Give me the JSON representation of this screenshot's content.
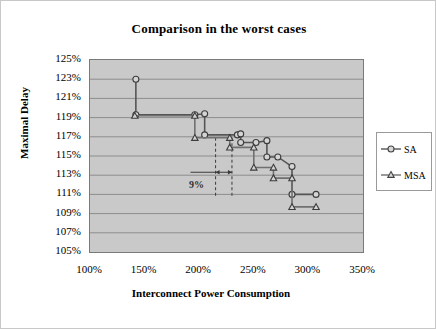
{
  "chart_data": {
    "type": "line",
    "title": "Comparison in the worst cases",
    "xlabel": "Interconnect Power Consumption",
    "ylabel": "Maximal Delay",
    "xlim": [
      100,
      350
    ],
    "ylim": [
      105,
      125
    ],
    "grid": true,
    "legend_position": "right",
    "xticks": [
      "100%",
      "150%",
      "200%",
      "250%",
      "300%",
      "350%"
    ],
    "yticks": [
      "105%",
      "107%",
      "109%",
      "111%",
      "113%",
      "115%",
      "117%",
      "119%",
      "121%",
      "123%",
      "125%"
    ],
    "annotations": [
      {
        "text": "9%",
        "x": 222,
        "y": 112.8,
        "style": "dashed-vertical-pair-with-arrow"
      }
    ],
    "series": [
      {
        "name": "SA",
        "marker": "circle",
        "color": "#555555",
        "points": [
          [
            142,
            123.0
          ],
          [
            142,
            119.3
          ],
          [
            196,
            119.3
          ],
          [
            205,
            119.4
          ],
          [
            205,
            117.2
          ],
          [
            235,
            117.2
          ],
          [
            238,
            117.3
          ],
          [
            238,
            116.4
          ],
          [
            252,
            116.4
          ],
          [
            262,
            116.6
          ],
          [
            262,
            114.9
          ],
          [
            272,
            114.9
          ],
          [
            285,
            113.9
          ],
          [
            285,
            111.0
          ],
          [
            307,
            111.0
          ]
        ]
      },
      {
        "name": "MSA",
        "marker": "triangle",
        "color": "#707070",
        "points": [
          [
            141,
            119.2
          ],
          [
            196,
            119.2
          ],
          [
            196,
            116.9
          ],
          [
            228,
            116.9
          ],
          [
            228,
            115.9
          ],
          [
            250,
            115.9
          ],
          [
            250,
            113.8
          ],
          [
            268,
            113.8
          ],
          [
            268,
            112.7
          ],
          [
            285,
            112.7
          ],
          [
            285,
            109.7
          ],
          [
            307,
            109.7
          ]
        ]
      }
    ]
  },
  "legend": {
    "items": [
      {
        "label": "SA",
        "marker": "circle"
      },
      {
        "label": "MSA",
        "marker": "triangle"
      }
    ]
  }
}
